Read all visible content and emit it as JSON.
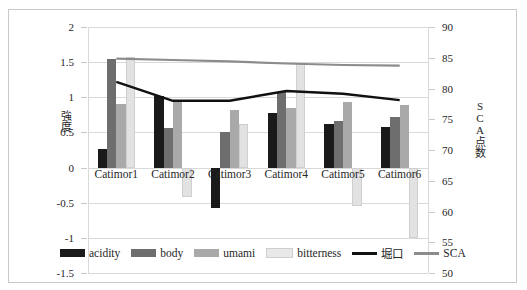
{
  "caption": {
    "text": ""
  },
  "chart_data": {
    "type": "bar",
    "title": "",
    "subtitle": "",
    "xlabel": "",
    "ylabel": "強度",
    "y2label": "SCA点数",
    "grid": true,
    "legend_position": "bottom",
    "categories": [
      "Catimor1",
      "Catimor2",
      "Catimor3",
      "Catimor4",
      "Catimor5",
      "Catimor6"
    ],
    "ylim": [
      -1.5,
      2
    ],
    "yticks": [
      "2",
      "1.5",
      "1",
      "0.5",
      "0",
      "-0.5",
      "-1",
      "-1.5"
    ],
    "y2lim": [
      50,
      90
    ],
    "y2ticks": [
      "90",
      "85",
      "80",
      "75",
      "70",
      "65",
      "60",
      "55",
      "50"
    ],
    "bar_series": [
      {
        "name": "acidity",
        "color": "#1a1a1a",
        "axis": "left",
        "values": [
          0.27,
          1.02,
          -0.58,
          0.77,
          0.62,
          0.58
        ]
      },
      {
        "name": "body",
        "color": "#6e6e6e",
        "axis": "left",
        "values": [
          1.55,
          0.57,
          0.5,
          1.08,
          0.66,
          0.72
        ]
      },
      {
        "name": "umami",
        "color": "#a9a9a9",
        "axis": "left",
        "values": [
          0.9,
          0.95,
          0.82,
          0.85,
          0.94,
          0.89
        ]
      },
      {
        "name": "bitterness",
        "color": "#e2e2e2",
        "axis": "left",
        "values": [
          1.57,
          -0.42,
          0.62,
          1.47,
          -0.55,
          -1.0
        ]
      }
    ],
    "line_series": [
      {
        "name": "堀口",
        "color": "#111111",
        "axis": "right",
        "values_left_scale": [
          1.22,
          0.95,
          0.95,
          1.09,
          1.05,
          0.96
        ],
        "values": [
          80.5,
          78.0,
          78.0,
          79.2,
          78.9,
          78.1
        ]
      },
      {
        "name": "SCA",
        "color": "#8c8c8c",
        "axis": "right",
        "values_left_scale": [
          1.55,
          1.53,
          1.51,
          1.48,
          1.46,
          1.45
        ],
        "values": [
          84.6,
          84.4,
          84.2,
          83.9,
          83.7,
          83.6
        ]
      }
    ],
    "legend": [
      "acidity",
      "body",
      "umami",
      "bitterness",
      "堀口",
      "SCA"
    ]
  }
}
